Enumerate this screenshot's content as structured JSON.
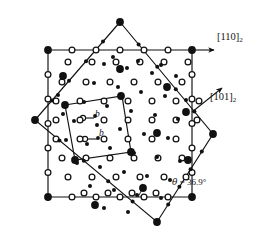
{
  "figure": {
    "type": "crystallographic-diagram",
    "background": "#ffffff",
    "ink": "#111111",
    "width": 276,
    "height": 242
  },
  "labels": {
    "direction_1": {
      "bracket": "[110]",
      "subscript": "2",
      "x": 217,
      "y": 38
    },
    "direction_2": {
      "bracket": "[101]",
      "subscript": "2",
      "x": 212,
      "y": 98
    },
    "angle": {
      "theta": "θ",
      "equals": " = 36.9°",
      "x": 178,
      "y": 182
    },
    "burgers_1": {
      "text": "b",
      "x": 92,
      "y": 119
    },
    "burgers_2": {
      "text": "b",
      "x": 95,
      "y": 135
    }
  },
  "geometry": {
    "square_axis_aligned": {
      "name": "lattice-1-square",
      "corners": [
        [
          48,
          50
        ],
        [
          192,
          50
        ],
        [
          192,
          197
        ],
        [
          48,
          197
        ]
      ],
      "rotation_deg": 0,
      "node_marker": "open-circle",
      "corner_marker": "filled-circle"
    },
    "square_rotated": {
      "name": "lattice-2-square",
      "corners": [
        [
          120,
          22
        ],
        [
          213,
          134
        ],
        [
          157,
          222
        ],
        [
          35,
          120
        ]
      ],
      "rotation_deg": 36.9,
      "node_marker": "filled-small-circle",
      "corner_marker": "filled-circle"
    },
    "unit_cell": {
      "name": "csl-unit-cell",
      "corners": [
        [
          65,
          105
        ],
        [
          122,
          96
        ],
        [
          131,
          152
        ],
        [
          75,
          160
        ]
      ]
    },
    "arrow_horizontal": {
      "from": [
        192,
        50
      ],
      "to": [
        213,
        50
      ]
    },
    "arrow_diagonal": {
      "from": [
        192,
        112
      ],
      "to": [
        222,
        88
      ]
    },
    "angle_arc": {
      "vertex": [
        160,
        197
      ],
      "radius": 22,
      "start_deg": 180,
      "sweep_deg": 36.9
    }
  },
  "markers": {
    "lattice_1_small_filled": {
      "role": "lattice-1-atom",
      "radius": 2.0,
      "fill": "#111111"
    },
    "lattice_2_open_ring": {
      "role": "lattice-2-atom",
      "radius": 2.9,
      "fill": "#ffffff",
      "stroke": "#111111"
    },
    "coincidence_site": {
      "role": "coincidence-site",
      "radius": 3.9,
      "fill": "#111111"
    }
  },
  "chart_data": {
    "type": "scatter",
    "xlabel": "",
    "ylabel": "",
    "xlim": [
      0,
      276
    ],
    "ylim": [
      0,
      242
    ],
    "grid": false,
    "legend_position": "none",
    "annotations": [
      "[110]2",
      "[101]2",
      "θ = 36.9°",
      "b",
      "b"
    ],
    "series": [
      {
        "name": "lattice-1 (small filled dots)",
        "marker": "filled-small-circle",
        "points": [
          [
            104,
            64
          ],
          [
            127,
            68
          ],
          [
            152,
            73
          ],
          [
            176,
            76
          ],
          [
            94,
            83
          ],
          [
            118,
            87
          ],
          [
            141,
            92
          ],
          [
            165,
            96
          ],
          [
            186,
            100
          ],
          [
            84,
            102
          ],
          [
            107,
            106
          ],
          [
            131,
            111
          ],
          [
            155,
            115
          ],
          [
            178,
            119
          ],
          [
            74,
            121
          ],
          [
            97,
            125
          ],
          [
            120,
            129
          ],
          [
            144,
            134
          ],
          [
            168,
            138
          ],
          [
            87,
            144
          ],
          [
            110,
            148
          ],
          [
            134,
            153
          ],
          [
            157,
            157
          ],
          [
            180,
            161
          ],
          [
            77,
            163
          ],
          [
            100,
            167
          ],
          [
            124,
            172
          ],
          [
            147,
            176
          ],
          [
            170,
            180
          ],
          [
            90,
            186
          ],
          [
            114,
            190
          ],
          [
            137,
            195
          ],
          [
            161,
            198
          ],
          [
            113,
            57
          ],
          [
            138,
            61
          ],
          [
            161,
            65
          ],
          [
            66,
            140
          ],
          [
            63,
            114
          ],
          [
            58,
            95
          ],
          [
            104,
            208
          ],
          [
            128,
            212
          ]
        ]
      },
      {
        "name": "lattice-2 (open circles)",
        "marker": "open-circle",
        "points": [
          [
            68,
            62
          ],
          [
            92,
            62
          ],
          [
            116,
            62
          ],
          [
            140,
            62
          ],
          [
            164,
            62
          ],
          [
            188,
            62
          ],
          [
            62,
            82
          ],
          [
            86,
            82
          ],
          [
            110,
            82
          ],
          [
            134,
            82
          ],
          [
            158,
            82
          ],
          [
            182,
            82
          ],
          [
            56,
            101
          ],
          [
            80,
            101
          ],
          [
            104,
            101
          ],
          [
            128,
            101
          ],
          [
            152,
            101
          ],
          [
            176,
            101
          ],
          [
            199,
            101
          ],
          [
            56,
            120
          ],
          [
            80,
            120
          ],
          [
            104,
            120
          ],
          [
            128,
            120
          ],
          [
            152,
            120
          ],
          [
            176,
            120
          ],
          [
            197,
            120
          ],
          [
            56,
            139
          ],
          [
            80,
            139
          ],
          [
            104,
            139
          ],
          [
            128,
            139
          ],
          [
            152,
            139
          ],
          [
            176,
            139
          ],
          [
            62,
            158
          ],
          [
            86,
            158
          ],
          [
            110,
            158
          ],
          [
            134,
            158
          ],
          [
            158,
            158
          ],
          [
            182,
            158
          ],
          [
            68,
            177
          ],
          [
            92,
            177
          ],
          [
            116,
            177
          ],
          [
            140,
            177
          ],
          [
            164,
            177
          ],
          [
            186,
            177
          ],
          [
            84,
            193
          ],
          [
            108,
            193
          ],
          [
            132,
            193
          ],
          [
            156,
            193
          ]
        ]
      },
      {
        "name": "coincidence sites (large filled dots)",
        "marker": "filled-large-circle",
        "points": [
          [
            120,
            69
          ],
          [
            167,
            87
          ],
          [
            121,
            96
          ],
          [
            65,
            105
          ],
          [
            186,
            112
          ],
          [
            131,
            152
          ],
          [
            75,
            160
          ],
          [
            157,
            133
          ],
          [
            143,
            188
          ],
          [
            95,
            205
          ],
          [
            63,
            76
          ],
          [
            188,
            160
          ]
        ]
      }
    ]
  }
}
